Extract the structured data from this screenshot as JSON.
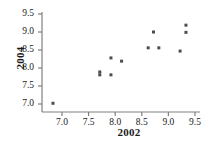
{
  "chart_data": {
    "type": "scatter",
    "title": "",
    "xlabel": "2002",
    "ylabel": "2004",
    "xlim": [
      6.72,
      9.62
    ],
    "ylim": [
      6.83,
      9.62
    ],
    "grid": false,
    "legend": null,
    "xticks": [
      "7.0",
      "7.5",
      "8.0",
      "8.5",
      "9.0",
      "9.5"
    ],
    "xtick_values": [
      7.0,
      7.5,
      8.0,
      8.5,
      9.0,
      9.5
    ],
    "yticks": [
      "7.0",
      "7.5",
      "8.0",
      "8.5",
      "9.0",
      "9.5"
    ],
    "ytick_values": [
      7.0,
      7.5,
      8.0,
      8.5,
      9.0,
      9.5
    ],
    "marker": {
      "shape": "square",
      "color": "#4d4d4d",
      "size_px": 3
    },
    "axis_color": "#808080",
    "points": [
      {
        "x": 6.83,
        "y": 7.02
      },
      {
        "x": 7.71,
        "y": 7.89
      },
      {
        "x": 7.71,
        "y": 7.81
      },
      {
        "x": 7.92,
        "y": 8.28
      },
      {
        "x": 7.92,
        "y": 7.81
      },
      {
        "x": 8.12,
        "y": 8.19
      },
      {
        "x": 8.62,
        "y": 8.56
      },
      {
        "x": 8.72,
        "y": 9.0
      },
      {
        "x": 8.82,
        "y": 8.56
      },
      {
        "x": 9.22,
        "y": 8.47
      },
      {
        "x": 9.33,
        "y": 9.19
      },
      {
        "x": 9.33,
        "y": 8.99
      }
    ]
  },
  "axes": {
    "x_title": "2002",
    "y_title": "2004"
  }
}
